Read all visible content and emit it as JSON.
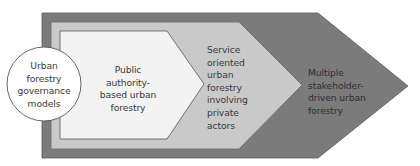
{
  "diagram": {
    "type": "nested-chevron progression",
    "colors": {
      "outer_stage": "#7b7b7b",
      "middle_stage": "#c9c9c9",
      "inner_stage": "#f3f3f3",
      "circle": "#ffffff",
      "outline": "#555555",
      "text": "#3a3a3a"
    },
    "circle": {
      "lines": [
        "Urban",
        "forestry",
        "governance",
        "models"
      ]
    },
    "stages": [
      {
        "name": "public-authority",
        "lines": [
          "Public",
          "authority-",
          "based urban",
          "forestry"
        ]
      },
      {
        "name": "service-oriented",
        "lines": [
          "Service",
          "oriented",
          "urban",
          "forestry",
          "involving",
          "private",
          "actors"
        ]
      },
      {
        "name": "multiple-stakeholder",
        "lines": [
          "Multiple",
          "stakeholder-",
          "driven urban",
          "forestry"
        ]
      }
    ]
  }
}
